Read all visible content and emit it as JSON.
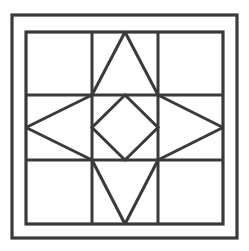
{
  "figure": {
    "kind": "geometric-line-diagram",
    "canvas": {
      "width": 249,
      "height": 251
    },
    "background_color": "#ffffff"
  },
  "style": {
    "line_color": "#3a3a3a",
    "line_color_light": "#4a4a4a",
    "panel_fill": "#ffffff",
    "outer_frame_width": 3.2,
    "inner_frame_width": 3.2,
    "grid_width": 3.0,
    "diagonal_width": 3.0
  },
  "geometry": {
    "outer_frame": {
      "x1": 12,
      "y1": 15,
      "x2": 237,
      "y2": 238
    },
    "inner_frame": {
      "x1": 26,
      "y1": 32,
      "x2": 223,
      "y2": 224
    },
    "grid": {
      "vertical_x": [
        92,
        158
      ],
      "horizontal_y": [
        95,
        160
      ]
    },
    "center_cell": {
      "x1": 92,
      "y1": 95,
      "x2": 158,
      "y2": 160
    },
    "center_point": {
      "x": 125,
      "y": 127.5
    },
    "diamond_vertices": [
      {
        "name": "top",
        "x": 125,
        "y": 95
      },
      {
        "name": "right",
        "x": 158,
        "y": 127.5
      },
      {
        "name": "bottom",
        "x": 125,
        "y": 160
      },
      {
        "name": "left",
        "x": 92,
        "y": 127.5
      }
    ],
    "star_points": [
      {
        "name": "north",
        "tip_x": 125,
        "tip_y": 32,
        "base_a_x": 92,
        "base_a_y": 95,
        "base_b_x": 158,
        "base_b_y": 95
      },
      {
        "name": "south",
        "tip_x": 125,
        "tip_y": 224,
        "base_a_x": 92,
        "base_a_y": 160,
        "base_b_x": 158,
        "base_b_y": 160
      },
      {
        "name": "west",
        "tip_x": 26,
        "tip_y": 127.5,
        "base_a_x": 92,
        "base_a_y": 95,
        "base_b_x": 92,
        "base_b_y": 160
      },
      {
        "name": "east",
        "tip_x": 223,
        "tip_y": 127.5,
        "base_a_x": 158,
        "base_a_y": 95,
        "base_b_x": 158,
        "base_b_y": 160
      }
    ]
  },
  "elements": {
    "outer_frame_label": "Outer frame border",
    "inner_frame_label": "Inner frame border",
    "corner_square_label": "Corner square block",
    "grid_label": "Three-by-three mullion grid",
    "diamond_label": "Central rotated square",
    "star_label": "Eight-point star motif"
  },
  "corner_squares": [
    {
      "name": "top-left",
      "x": 12,
      "y": 15,
      "w": 14,
      "h": 17
    },
    {
      "name": "top-right",
      "x": 223,
      "y": 15,
      "w": 14,
      "h": 17
    },
    {
      "name": "bottom-left",
      "x": 12,
      "y": 224,
      "w": 14,
      "h": 14
    },
    {
      "name": "bottom-right",
      "x": 223,
      "y": 224,
      "w": 14,
      "h": 14
    }
  ]
}
